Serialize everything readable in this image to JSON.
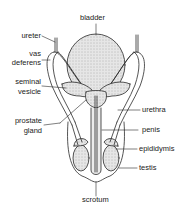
{
  "diagram": {
    "labels": {
      "bladder": "bladder",
      "ureter": "ureter",
      "vas_deferens_1": "vas",
      "vas_deferens_2": "deferens",
      "seminal_vesicle_1": "seminal",
      "seminal_vesicle_2": "vesicle",
      "prostate_gland_1": "prostate",
      "prostate_gland_2": "gland",
      "urethra": "urethra",
      "penis": "penis",
      "epididymis": "epididymis",
      "testis": "testis",
      "scrotum": "scrotum"
    },
    "colors": {
      "line": "#2a2a2a",
      "fill_shade": "#d8d8d8",
      "background": "#ffffff"
    }
  }
}
